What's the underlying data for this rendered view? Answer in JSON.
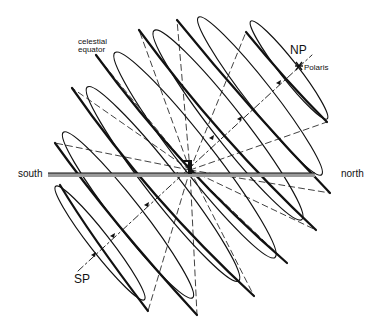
{
  "figure": {
    "labels": {
      "celestial_equator_line1": "celestial",
      "celestial_equator_line2": "equator",
      "north_pole": "NP",
      "polaris": "Polaris",
      "south_pole": "SP",
      "south": "south",
      "north": "north"
    },
    "colors": {
      "ink": "#111111",
      "horizon_shade": "#9a9a9a",
      "background": "#ffffff"
    },
    "elements": {
      "diurnal_circle_count": 7,
      "polar_axis": "dash-dot line from SP to NP",
      "horizon": "horizontal shaded line",
      "observer": "small vertical figure at center"
    }
  }
}
